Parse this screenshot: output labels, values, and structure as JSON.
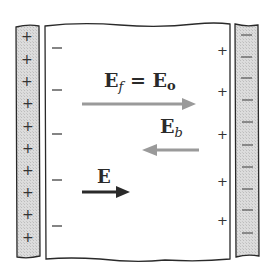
{
  "diagram": {
    "colors": {
      "plate_fill": "#d6d6d6",
      "outline": "#2a2a2a",
      "free_field_arrow": "#9a9a9a",
      "bound_field_arrow": "#9a9a9a",
      "net_field_arrow": "#2a2a2a"
    },
    "left_plate": {
      "charge_symbol": "+",
      "count": 10
    },
    "right_plate": {
      "charge_symbol": "−",
      "count": 10
    },
    "dielectric": {
      "left_surface_symbol": "−",
      "left_surface_count": 5,
      "right_surface_symbol": "+",
      "right_surface_count": 5
    },
    "fields": {
      "free": {
        "label_main": "E",
        "label_sub": "f",
        "label_eq": " = ",
        "label_rhs_main": "E",
        "label_rhs_sub": "o",
        "direction": "right"
      },
      "bound": {
        "label_main": "E",
        "label_sub": "b",
        "direction": "left"
      },
      "net": {
        "label_main": "E",
        "direction": "right"
      }
    }
  }
}
